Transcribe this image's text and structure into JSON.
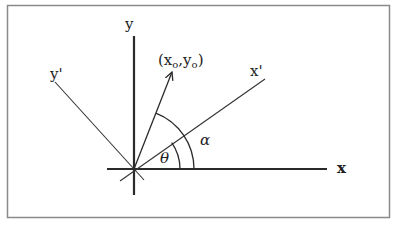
{
  "diagram": {
    "type": "coordinate-rotation",
    "labels": {
      "x_axis": "x",
      "y_axis": "y",
      "x_prime_axis": "x'",
      "y_prime_axis": "y'",
      "point_open": "(x",
      "point_sub1": "o",
      "point_mid": ",y",
      "point_sub2": "o",
      "point_close": ")",
      "theta": "θ",
      "alpha": "α"
    },
    "colors": {
      "line": "#2a2a2a",
      "frame": "#8a8a8a",
      "background": "#ffffff"
    }
  }
}
